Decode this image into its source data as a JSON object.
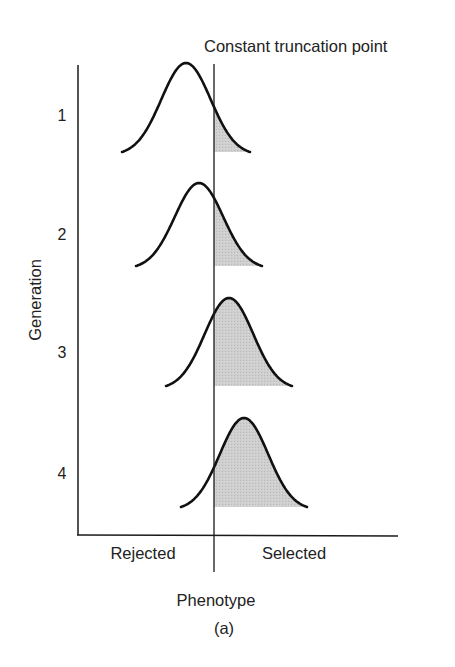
{
  "figure": {
    "truncation_label": "Constant truncation point",
    "y_axis_label": "Generation",
    "x_axis_label": "Phenotype",
    "caption": "(a)",
    "region_labels": {
      "left": "Rejected",
      "right": "Selected"
    },
    "generations": [
      {
        "label": "1",
        "mean_x": 186,
        "peak_y": 63,
        "base_y": 152,
        "half_width": 64
      },
      {
        "label": "2",
        "mean_x": 199,
        "peak_y": 183,
        "base_y": 266,
        "half_width": 63
      },
      {
        "label": "3",
        "mean_x": 229,
        "peak_y": 298,
        "base_y": 386,
        "half_width": 63
      },
      {
        "label": "4",
        "mean_x": 244,
        "peak_y": 418,
        "base_y": 507,
        "half_width": 63
      }
    ],
    "truncation_x": 214,
    "colors": {
      "curve": "#111111",
      "axis": "#1a1a1a",
      "shade": "#cbcbcb",
      "text": "#222222",
      "background": "#ffffff"
    }
  }
}
